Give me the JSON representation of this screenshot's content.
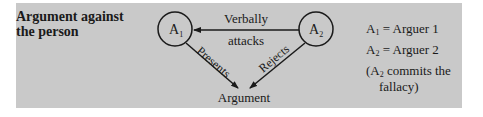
{
  "diagram": {
    "title_line1": "Argument against",
    "title_line2": "the person",
    "nodes": {
      "a1": {
        "letter": "A",
        "sub": "1"
      },
      "a2": {
        "letter": "A",
        "sub": "2"
      },
      "argument": "Argument"
    },
    "edges": {
      "attack_line1": "Verbally",
      "attack_line2": "attacks",
      "presents": "Presents",
      "rejects": "Rejects"
    },
    "legend": {
      "row1": {
        "letter": "A",
        "sub": "1",
        "text": " = Arguer 1"
      },
      "row2": {
        "letter": "A",
        "sub": "2",
        "text": " = Arguer 2"
      },
      "note_open": "(A",
      "note_sub": "2",
      "note_rest": " commits the",
      "note_line2": "fallacy)"
    },
    "colors": {
      "panel": "#c9c9c9",
      "ink": "#1a1a1a"
    }
  }
}
